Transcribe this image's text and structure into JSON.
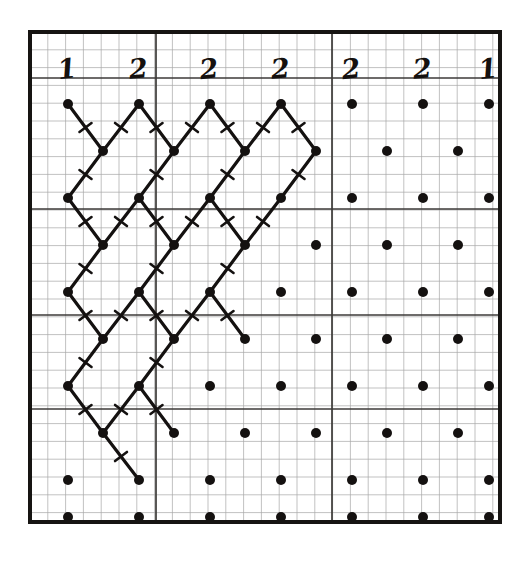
{
  "figure": {
    "kind": "scanned-lattice-diagram",
    "caption_present": false,
    "background_color": "#ffffff",
    "ink_color": "#141110",
    "grid_minor_color": "#8c8c8c",
    "grid_major_color": "#3a3a3a",
    "border_color": "#161412",
    "paper": "graph-paper",
    "frame": {
      "x": 30,
      "y": 32,
      "width": 470,
      "height": 490,
      "stroke_width": 4
    }
  },
  "column_labels": {
    "values": [
      "1",
      "2",
      "2",
      "2",
      "2",
      "2",
      "1"
    ],
    "x_positions": [
      68,
      139,
      210,
      281,
      352,
      423,
      489
    ],
    "y": 78,
    "description": "handwritten bold italic digits across the top of the frame"
  },
  "grid": {
    "minor_spacing_px": 17.8,
    "major_spacing_px": 71,
    "major_vertical_x": [
      30,
      156,
      332,
      500
    ],
    "major_horizontal_y": [
      32,
      78,
      209,
      315,
      409,
      522
    ],
    "minor_vertical_count": 27,
    "minor_horizontal_count": 28
  },
  "lattice": {
    "type": "centered-rectangular-staggered",
    "dot_radius": 5.0,
    "dot_color": "#141110",
    "row_spacing_px": 47,
    "col_spacing_px": 71,
    "stagger_offset_px": 35.5,
    "origin_x": 68,
    "origin_y": 104,
    "rows": 10,
    "cols": 7,
    "rows_detail": [
      {
        "index": 0,
        "y": 104,
        "offset": 0,
        "xs": [
          68,
          139,
          210,
          281,
          352,
          423,
          489
        ]
      },
      {
        "index": 1,
        "y": 151,
        "offset": 35.5,
        "xs": [
          103,
          174,
          245,
          316,
          387,
          458
        ]
      },
      {
        "index": 2,
        "y": 198,
        "offset": 0,
        "xs": [
          68,
          139,
          210,
          281,
          352,
          423,
          489
        ]
      },
      {
        "index": 3,
        "y": 245,
        "offset": 35.5,
        "xs": [
          103,
          174,
          245,
          316,
          387,
          458
        ]
      },
      {
        "index": 4,
        "y": 292,
        "offset": 0,
        "xs": [
          68,
          139,
          210,
          281,
          352,
          423,
          489
        ]
      },
      {
        "index": 5,
        "y": 339,
        "offset": 35.5,
        "xs": [
          103,
          174,
          245,
          316,
          387,
          458
        ]
      },
      {
        "index": 6,
        "y": 386,
        "offset": 0,
        "xs": [
          68,
          139,
          210,
          281,
          352,
          423,
          489
        ]
      },
      {
        "index": 7,
        "y": 433,
        "offset": 35.5,
        "xs": [
          103,
          174,
          245,
          316,
          387,
          458
        ]
      },
      {
        "index": 8,
        "y": 480,
        "offset": 0,
        "xs": [
          68,
          139,
          210,
          281,
          352,
          423,
          489
        ]
      },
      {
        "index": 9,
        "y": 517,
        "offset": 35.5,
        "xs": [
          68,
          139,
          210,
          281,
          352,
          423,
          489
        ]
      }
    ]
  },
  "bonds": {
    "stroke_width": 3.2,
    "color": "#141110",
    "tick_mark": {
      "present": true,
      "length_px": 15,
      "stroke_width": 2.6,
      "orientation": "perpendicular-at-midpoint",
      "description": "small slash crossing each diagonal bond at its midpoint forming an X"
    },
    "region": "upper-left quadrant of the lattice",
    "segments": [
      [
        68,
        104,
        103,
        151
      ],
      [
        103,
        151,
        139,
        104
      ],
      [
        139,
        104,
        174,
        151
      ],
      [
        174,
        151,
        210,
        104
      ],
      [
        210,
        104,
        245,
        151
      ],
      [
        245,
        151,
        281,
        104
      ],
      [
        281,
        104,
        316,
        151
      ],
      [
        68,
        104,
        103,
        151
      ],
      [
        103,
        151,
        68,
        198
      ],
      [
        139,
        104,
        103,
        151
      ],
      [
        139,
        104,
        174,
        151
      ],
      [
        174,
        151,
        139,
        198
      ],
      [
        210,
        104,
        174,
        151
      ],
      [
        245,
        151,
        210,
        198
      ],
      [
        281,
        104,
        245,
        151
      ],
      [
        316,
        151,
        281,
        198
      ],
      [
        68,
        198,
        103,
        245
      ],
      [
        103,
        245,
        139,
        198
      ],
      [
        139,
        198,
        174,
        245
      ],
      [
        174,
        245,
        210,
        198
      ],
      [
        210,
        198,
        245,
        245
      ],
      [
        245,
        245,
        281,
        198
      ],
      [
        68,
        198,
        103,
        151
      ],
      [
        103,
        245,
        68,
        292
      ],
      [
        139,
        198,
        103,
        245
      ],
      [
        174,
        245,
        139,
        292
      ],
      [
        210,
        198,
        174,
        245
      ],
      [
        245,
        245,
        210,
        292
      ],
      [
        281,
        198,
        245,
        245
      ],
      [
        68,
        292,
        103,
        339
      ],
      [
        103,
        339,
        139,
        292
      ],
      [
        139,
        292,
        174,
        339
      ],
      [
        174,
        339,
        210,
        292
      ],
      [
        210,
        292,
        245,
        339
      ],
      [
        103,
        339,
        68,
        386
      ],
      [
        139,
        292,
        103,
        339
      ],
      [
        174,
        339,
        139,
        386
      ],
      [
        210,
        292,
        174,
        339
      ],
      [
        68,
        386,
        103,
        433
      ],
      [
        103,
        433,
        139,
        386
      ],
      [
        139,
        386,
        174,
        433
      ],
      [
        103,
        433,
        139,
        480
      ],
      [
        139,
        386,
        103,
        433
      ]
    ]
  }
}
